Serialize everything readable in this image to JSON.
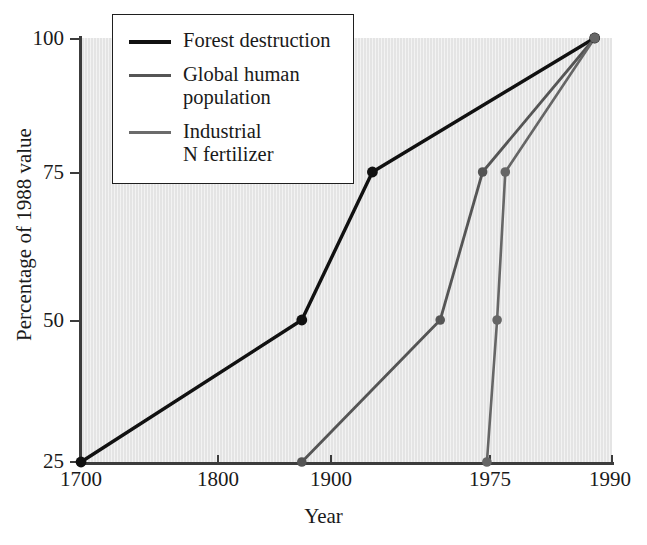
{
  "chart_data": {
    "type": "line",
    "title": "",
    "xlabel": "Year",
    "ylabel": "Percentage of 1988 value",
    "xticks": [
      "1700",
      "1800",
      "1900",
      "1975",
      "1990"
    ],
    "xtick_values": [
      1700,
      1800,
      1900,
      1975,
      1990
    ],
    "yticks": [
      "25",
      "50",
      "75",
      "100"
    ],
    "ytick_values": [
      25,
      50,
      75,
      100
    ],
    "ylim": [
      25,
      100
    ],
    "xlim": [
      1700,
      1990
    ],
    "x_axis_scale": "non-linear (compressed after 1900)",
    "grid": false,
    "legend_position": "top-left inside plot",
    "plot_background": "#e4e4e4",
    "series": [
      {
        "name": "Forest destruction",
        "color": "#111111",
        "width": 3.4,
        "points": [
          {
            "x": 1700,
            "y": 25
          },
          {
            "x": 1875,
            "y": 50
          },
          {
            "x": 1920,
            "y": 75
          },
          {
            "x": 1988,
            "y": 100
          }
        ]
      },
      {
        "name": "Global human population",
        "color": "#555555",
        "width": 2.8,
        "points": [
          {
            "x": 1875,
            "y": 25
          },
          {
            "x": 1952,
            "y": 50
          },
          {
            "x": 1972,
            "y": 75
          },
          {
            "x": 1988,
            "y": 100
          }
        ]
      },
      {
        "name": "Industrial N fertilizer",
        "color": "#666666",
        "width": 2.6,
        "points": [
          {
            "x": 1974,
            "y": 25
          },
          {
            "x": 1976,
            "y": 50
          },
          {
            "x": 1977,
            "y": 75
          },
          {
            "x": 1988,
            "y": 100
          }
        ]
      }
    ]
  },
  "legend": {
    "title": "",
    "entries": [
      {
        "label": "Forest destruction",
        "color": "#111111",
        "thickness": "4px"
      },
      {
        "label": "Global human\npopulation",
        "color": "#555555",
        "thickness": "3px"
      },
      {
        "label": "Industrial\nN fertilizer",
        "color": "#6b6b6b",
        "thickness": "2.5px"
      }
    ]
  },
  "axes": {
    "x_title": "Year",
    "y_title": "Percentage of 1988 value",
    "x_tick_labels": [
      "1700",
      "1800",
      "1900",
      "1975",
      "1990"
    ],
    "y_tick_labels": [
      "100",
      "75",
      "50",
      "25"
    ]
  }
}
